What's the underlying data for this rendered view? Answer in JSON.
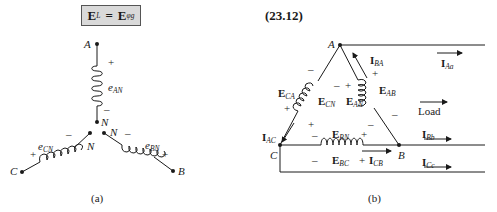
{
  "formula": {
    "lhs_main": "E",
    "lhs_sub": "L",
    "equals": "=",
    "rhs_main": "E",
    "rhs_sub": "φg"
  },
  "equation_number": "(23.12)",
  "figure_a": {
    "caption": "(a)",
    "nodes": {
      "A": "A",
      "B": "B",
      "C": "C",
      "N1": "N",
      "N2": "N",
      "N3": "N"
    },
    "coils": [
      {
        "name": "e",
        "sub": "AN",
        "plus": "+",
        "minus": "–"
      },
      {
        "name": "e",
        "sub": "CN",
        "plus": "+",
        "minus": "–"
      },
      {
        "name": "e",
        "sub": "BN",
        "plus": "+",
        "minus": "–"
      }
    ]
  },
  "figure_b": {
    "caption": "(b)",
    "nodes": {
      "A": "A",
      "B": "B",
      "C": "C"
    },
    "voltages": {
      "CA": {
        "main": "E",
        "sub": "CA"
      },
      "CN": {
        "main": "E",
        "sub": "CN"
      },
      "AN": {
        "main": "E",
        "sub": "AN"
      },
      "AB": {
        "main": "E",
        "sub": "AB"
      },
      "BN": {
        "main": "E",
        "sub": "BN"
      },
      "BC": {
        "main": "E",
        "sub": "BC"
      }
    },
    "currents": {
      "BA": {
        "main": "I",
        "sub": "BA"
      },
      "AC": {
        "main": "I",
        "sub": "AC"
      },
      "CB": {
        "main": "I",
        "sub": "CB"
      },
      "Aa": {
        "main": "I",
        "sub": "Aa"
      },
      "Bb": {
        "main": "I",
        "sub": "Bb"
      },
      "Cc": {
        "main": "I",
        "sub": "Cc"
      }
    },
    "load_label": "Load",
    "signs": {
      "plus": "+",
      "minus": "–"
    }
  }
}
